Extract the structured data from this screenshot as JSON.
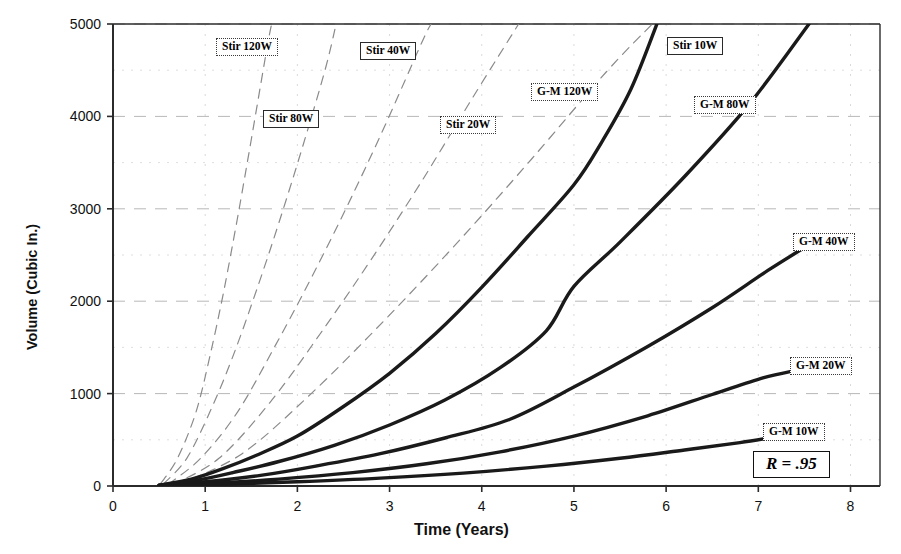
{
  "chart_data": {
    "type": "line",
    "title": "",
    "xlabel": "Time (Years)",
    "ylabel": "Volume (Cubic In.)",
    "xlim": [
      0,
      8.32
    ],
    "ylim": [
      0,
      5000
    ],
    "xticks": [
      0,
      1,
      2,
      3,
      4,
      5,
      6,
      7,
      8
    ],
    "yticks": [
      0,
      1000,
      2000,
      3000,
      4000,
      5000
    ],
    "xtick_labels": [
      "0",
      "1",
      "2",
      "3",
      "4",
      "5",
      "6",
      "7",
      "8"
    ],
    "ytick_labels": [
      "0",
      "1000",
      "2000",
      "3000",
      "4000",
      "5000"
    ],
    "grid": true,
    "legend": "inline-callout-boxes",
    "annotation": "R = .95",
    "series": [
      {
        "name": "G-M  120W",
        "style": "solid",
        "points": [
          [
            0.5,
            10
          ],
          [
            0.85,
            75
          ],
          [
            1.2,
            190
          ],
          [
            1.55,
            330
          ],
          [
            2.0,
            540
          ],
          [
            2.5,
            860
          ],
          [
            3.0,
            1220
          ],
          [
            3.5,
            1650
          ],
          [
            4.0,
            2150
          ],
          [
            4.5,
            2700
          ],
          [
            5.0,
            3260
          ],
          [
            5.3,
            3720
          ],
          [
            5.62,
            4300
          ],
          [
            5.9,
            5000
          ]
        ]
      },
      {
        "name": "G-M  80W",
        "style": "solid",
        "points": [
          [
            0.5,
            8
          ],
          [
            0.9,
            60
          ],
          [
            1.3,
            145
          ],
          [
            1.8,
            265
          ],
          [
            2.4,
            440
          ],
          [
            3.0,
            660
          ],
          [
            3.6,
            930
          ],
          [
            4.2,
            1280
          ],
          [
            4.7,
            1680
          ],
          [
            5.0,
            2160
          ],
          [
            5.5,
            2640
          ],
          [
            6.2,
            3350
          ],
          [
            6.9,
            4130
          ],
          [
            7.55,
            5000
          ]
        ]
      },
      {
        "name": "G-M  40W",
        "style": "solid",
        "points": [
          [
            0.5,
            6
          ],
          [
            1.0,
            45
          ],
          [
            1.6,
            115
          ],
          [
            2.2,
            215
          ],
          [
            2.9,
            350
          ],
          [
            3.6,
            520
          ],
          [
            4.3,
            720
          ],
          [
            5.0,
            1070
          ],
          [
            5.8,
            1510
          ],
          [
            6.5,
            1930
          ],
          [
            7.1,
            2330
          ],
          [
            7.55,
            2610
          ]
        ]
      },
      {
        "name": "G-M  20W",
        "style": "solid",
        "points": [
          [
            0.5,
            5
          ],
          [
            1.1,
            30
          ],
          [
            1.8,
            75
          ],
          [
            2.6,
            145
          ],
          [
            3.4,
            240
          ],
          [
            4.2,
            370
          ],
          [
            5.0,
            540
          ],
          [
            5.8,
            760
          ],
          [
            6.5,
            990
          ],
          [
            7.05,
            1170
          ],
          [
            7.4,
            1250
          ]
        ]
      },
      {
        "name": "G-M  10W",
        "style": "solid",
        "points": [
          [
            0.5,
            4
          ],
          [
            1.2,
            18
          ],
          [
            2.0,
            45
          ],
          [
            2.9,
            85
          ],
          [
            3.8,
            140
          ],
          [
            4.7,
            215
          ],
          [
            5.5,
            300
          ],
          [
            6.2,
            390
          ],
          [
            6.8,
            470
          ],
          [
            7.15,
            525
          ]
        ]
      },
      {
        "name": "Stir 120W",
        "style": "dashed",
        "points": [
          [
            0.52,
            30
          ],
          [
            0.7,
            300
          ],
          [
            0.9,
            800
          ],
          [
            1.05,
            1400
          ],
          [
            1.2,
            2100
          ],
          [
            1.35,
            2900
          ],
          [
            1.5,
            3750
          ],
          [
            1.66,
            4680
          ],
          [
            1.72,
            5000
          ]
        ]
      },
      {
        "name": "Stir 80W",
        "style": "dashed",
        "points": [
          [
            0.55,
            25
          ],
          [
            0.8,
            300
          ],
          [
            1.05,
            800
          ],
          [
            1.3,
            1400
          ],
          [
            1.55,
            2100
          ],
          [
            1.8,
            2850
          ],
          [
            2.05,
            3650
          ],
          [
            2.3,
            4500
          ],
          [
            2.42,
            5000
          ]
        ]
      },
      {
        "name": "Stir 40W",
        "style": "dashed",
        "points": [
          [
            0.6,
            20
          ],
          [
            0.95,
            300
          ],
          [
            1.35,
            800
          ],
          [
            1.75,
            1500
          ],
          [
            2.15,
            2250
          ],
          [
            2.55,
            3050
          ],
          [
            2.95,
            3900
          ],
          [
            3.35,
            4800
          ],
          [
            3.45,
            5000
          ]
        ]
      },
      {
        "name": "Stir 20W",
        "style": "dashed",
        "points": [
          [
            0.65,
            15
          ],
          [
            1.15,
            300
          ],
          [
            1.7,
            900
          ],
          [
            2.25,
            1650
          ],
          [
            2.8,
            2450
          ],
          [
            3.35,
            3300
          ],
          [
            3.9,
            4200
          ],
          [
            4.4,
            5000
          ]
        ]
      },
      {
        "name": "Stir 10W",
        "style": "dashed",
        "points": [
          [
            0.7,
            12
          ],
          [
            1.4,
            350
          ],
          [
            2.15,
            1000
          ],
          [
            2.95,
            1800
          ],
          [
            3.75,
            2650
          ],
          [
            4.55,
            3550
          ],
          [
            5.35,
            4480
          ],
          [
            5.85,
            5000
          ]
        ]
      }
    ],
    "callouts": [
      {
        "label": "Stir 120W",
        "x": 216,
        "y": 38,
        "border": "dotted"
      },
      {
        "label": "Stir 40W",
        "x": 360,
        "y": 42,
        "border": "solid"
      },
      {
        "label": "Stir 80W",
        "x": 263,
        "y": 110,
        "border": "solid"
      },
      {
        "label": "Stir 20W",
        "x": 440,
        "y": 116,
        "border": "dotted"
      },
      {
        "label": "Stir 10W",
        "x": 667,
        "y": 37,
        "border": "solid"
      },
      {
        "label": "G-M  120W",
        "x": 531,
        "y": 83,
        "border": "dotted"
      },
      {
        "label": "G-M  80W",
        "x": 694,
        "y": 96,
        "border": "dotted"
      },
      {
        "label": "G-M  40W",
        "x": 793,
        "y": 233,
        "border": "dotted"
      },
      {
        "label": "G-M  20W",
        "x": 790,
        "y": 357,
        "border": "dotted"
      },
      {
        "label": "G-M  10W",
        "x": 763,
        "y": 423,
        "border": "dotted"
      }
    ]
  },
  "colors": {
    "axis": "#2b2b2b",
    "curve_solid": "#1a1a1a",
    "curve_dashed": "#8a8a8a",
    "grid": "#b8b8b8",
    "background": "#ffffff"
  }
}
